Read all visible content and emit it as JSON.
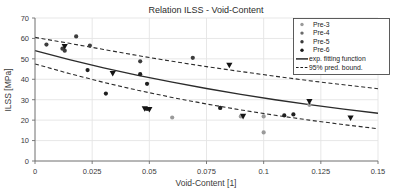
{
  "chart_data": {
    "type": "scatter",
    "title": "Relation ILSS - Void-Content",
    "xlabel": "Void-Content [1]",
    "ylabel": "ILSS [MPa]",
    "xlim": [
      0,
      0.15
    ],
    "ylim": [
      0,
      70
    ],
    "xticks": [
      0,
      0.025,
      0.05,
      0.075,
      0.1,
      0.125,
      0.15
    ],
    "xticklabels": [
      "0",
      "0.025",
      "0.05",
      "0.075",
      "0.1",
      "0.125",
      "0.15"
    ],
    "yticks": [
      0,
      10,
      20,
      30,
      40,
      50,
      60,
      70
    ],
    "yticklabels": [
      "0",
      "10",
      "20",
      "30",
      "40",
      "50",
      "60",
      "70"
    ],
    "grid": true,
    "legend_position": "upper right",
    "series": [
      {
        "name": "Pre-3",
        "marker": "dot",
        "color": "#9a9a9a",
        "points": [
          {
            "x": 0.06,
            "y": 21.3
          },
          {
            "x": 0.081,
            "y": 26.0
          },
          {
            "x": 0.09,
            "y": 21.8
          },
          {
            "x": 0.1,
            "y": 21.8
          },
          {
            "x": 0.1,
            "y": 14.0
          },
          {
            "x": 0.12,
            "y": 27.5
          }
        ]
      },
      {
        "name": "Pre-4",
        "marker": "dot",
        "color": "#3d3d3d",
        "points": [
          {
            "x": 0.005,
            "y": 57.0
          },
          {
            "x": 0.012,
            "y": 55.0
          },
          {
            "x": 0.013,
            "y": 54.0
          },
          {
            "x": 0.018,
            "y": 61.0
          },
          {
            "x": 0.024,
            "y": 56.5
          },
          {
            "x": 0.046,
            "y": 48.8
          },
          {
            "x": 0.069,
            "y": 50.5
          }
        ]
      },
      {
        "name": "Pre-5",
        "marker": "dot",
        "color": "#1f1f1f",
        "points": [
          {
            "x": 0.023,
            "y": 44.5
          },
          {
            "x": 0.031,
            "y": 33.0
          },
          {
            "x": 0.046,
            "y": 42.5
          },
          {
            "x": 0.049,
            "y": 37.8
          },
          {
            "x": 0.049,
            "y": 25.5
          },
          {
            "x": 0.081,
            "y": 26.0
          },
          {
            "x": 0.109,
            "y": 22.3
          },
          {
            "x": 0.113,
            "y": 22.8
          }
        ]
      },
      {
        "name": "Pre-6",
        "marker": "triangle-down",
        "color": "#141414",
        "points": [
          {
            "x": 0.013,
            "y": 56.0
          },
          {
            "x": 0.034,
            "y": 42.8
          },
          {
            "x": 0.048,
            "y": 25.5
          },
          {
            "x": 0.05,
            "y": 25.2
          },
          {
            "x": 0.085,
            "y": 46.8
          },
          {
            "x": 0.091,
            "y": 21.8
          },
          {
            "x": 0.12,
            "y": 29.0
          },
          {
            "x": 0.138,
            "y": 21.0
          }
        ]
      }
    ],
    "fit_curve": {
      "name": "exp. fitting function",
      "style": "solid",
      "color": "#2b2b2b",
      "points": [
        {
          "x": 0.0,
          "y": 54.0
        },
        {
          "x": 0.015,
          "y": 49.6
        },
        {
          "x": 0.03,
          "y": 45.6
        },
        {
          "x": 0.045,
          "y": 41.9
        },
        {
          "x": 0.06,
          "y": 38.6
        },
        {
          "x": 0.075,
          "y": 35.5
        },
        {
          "x": 0.09,
          "y": 32.6
        },
        {
          "x": 0.105,
          "y": 30.0
        },
        {
          "x": 0.12,
          "y": 27.6
        },
        {
          "x": 0.135,
          "y": 25.4
        },
        {
          "x": 0.15,
          "y": 23.4
        }
      ]
    },
    "bounds": {
      "name": "95% pred. bound.",
      "style": "dashed",
      "color": "#2b2b2b",
      "upper": [
        {
          "x": 0.0,
          "y": 60.5
        },
        {
          "x": 0.015,
          "y": 57.6
        },
        {
          "x": 0.03,
          "y": 54.6
        },
        {
          "x": 0.045,
          "y": 51.6
        },
        {
          "x": 0.06,
          "y": 48.8
        },
        {
          "x": 0.075,
          "y": 46.2
        },
        {
          "x": 0.09,
          "y": 43.8
        },
        {
          "x": 0.105,
          "y": 41.5
        },
        {
          "x": 0.12,
          "y": 39.3
        },
        {
          "x": 0.135,
          "y": 37.3
        },
        {
          "x": 0.15,
          "y": 35.4
        }
      ],
      "lower": [
        {
          "x": 0.0,
          "y": 47.5
        },
        {
          "x": 0.015,
          "y": 42.8
        },
        {
          "x": 0.03,
          "y": 38.5
        },
        {
          "x": 0.045,
          "y": 34.6
        },
        {
          "x": 0.06,
          "y": 31.1
        },
        {
          "x": 0.075,
          "y": 27.9
        },
        {
          "x": 0.09,
          "y": 25.0
        },
        {
          "x": 0.105,
          "y": 22.4
        },
        {
          "x": 0.12,
          "y": 20.0
        },
        {
          "x": 0.135,
          "y": 17.8
        },
        {
          "x": 0.15,
          "y": 15.8
        }
      ]
    },
    "legend_entries": [
      {
        "label": "Pre-3",
        "kind": "marker",
        "color": "#9a9a9a"
      },
      {
        "label": "Pre-4",
        "kind": "marker",
        "color": "#6a6a6a"
      },
      {
        "label": "Pre-5",
        "kind": "marker",
        "color": "#3a3a3a"
      },
      {
        "label": "Pre-6",
        "kind": "marker",
        "color": "#1a1a1a"
      },
      {
        "label": "exp. fitting function",
        "kind": "solid-line",
        "color": "#1a1a1a"
      },
      {
        "label": "95% pred. bound.",
        "kind": "dashed-line",
        "color": "#1a1a1a"
      }
    ]
  },
  "style": {
    "background": "#ffffff",
    "axis_color": "#6e6e6e",
    "grid_color": "#e4e4e4",
    "text_color": "#2b2b2b"
  }
}
